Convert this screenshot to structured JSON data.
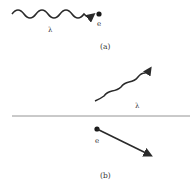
{
  "panel_a": {
    "caption": "(a)",
    "wave_label": "λ",
    "particle_label": "e"
  },
  "panel_b": {
    "caption": "(b)",
    "wave_label": "λ",
    "particle_label": "e"
  },
  "colors": {
    "ink": "#2a2a2a",
    "divider": "#888888"
  }
}
